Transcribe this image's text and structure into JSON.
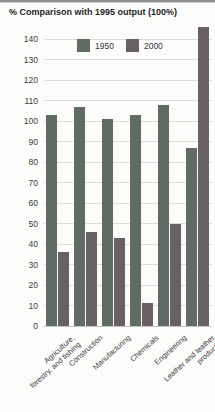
{
  "page": {
    "title": "% Comparison with 1995 output (100%)"
  },
  "chart_data": {
    "type": "bar",
    "title": "% Comparison with 1995 output (100%)",
    "xlabel": "",
    "ylabel": "",
    "categories": [
      "Agriculture,\nforestry, and fishing",
      "Construction",
      "Manufacturing",
      "Chemicals",
      "Engineering",
      "Leather and leather\nproducts"
    ],
    "series": [
      {
        "name": "1950",
        "color": "#5f6b63",
        "values": [
          103,
          107,
          101,
          103,
          108,
          87
        ]
      },
      {
        "name": "2000",
        "color": "#696066",
        "values": [
          36,
          46,
          43,
          11,
          50,
          147
        ]
      }
    ],
    "ylim": [
      0,
      146
    ],
    "yticks": [
      0,
      10,
      20,
      30,
      40,
      50,
      60,
      70,
      80,
      90,
      100,
      110,
      120,
      130,
      140
    ],
    "grid": true,
    "legend_position": "top-inside",
    "note_colors": {
      "background": "#fcfcfa",
      "gridline": "#dcdcd7",
      "text": "#3a3a3a"
    }
  }
}
